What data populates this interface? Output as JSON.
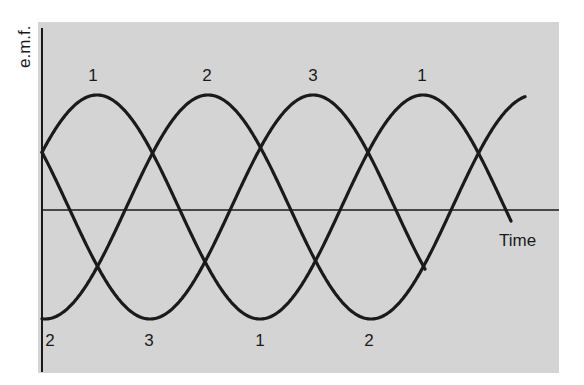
{
  "chart_data": {
    "type": "line",
    "title": "",
    "xlabel": "Time",
    "ylabel": "e.m.f.",
    "grid": false,
    "legend": "none (phases labeled directly at peaks and troughs)",
    "x": [
      0,
      30,
      60,
      90,
      120,
      150,
      180,
      210,
      240,
      270,
      300,
      330,
      360,
      390,
      420,
      450,
      480,
      510,
      540,
      570
    ],
    "x_unit": "phase angle (degrees), arbitrary; axis has no tick marks",
    "series": [
      {
        "name": "1",
        "phase_deg": 0,
        "values": [
          0.5,
          0.87,
          1.0,
          0.87,
          0.5,
          0.0,
          -0.5,
          -0.87,
          -1.0,
          -0.87,
          -0.5,
          0.0,
          0.5,
          0.87,
          1.0,
          0.87,
          0.5,
          0.0,
          -0.1,
          null
        ]
      },
      {
        "name": "2",
        "phase_deg": -120,
        "values": [
          -1.0,
          -0.87,
          -0.5,
          0.0,
          0.5,
          0.87,
          1.0,
          0.87,
          0.5,
          0.0,
          -0.5,
          -0.87,
          -1.0,
          -0.87,
          -0.5,
          0.0,
          0.5,
          0.87,
          1.0,
          null
        ]
      },
      {
        "name": "3",
        "phase_deg": 120,
        "values": [
          0.5,
          0.0,
          -0.5,
          -0.87,
          -1.0,
          -0.87,
          -0.5,
          0.0,
          0.5,
          0.87,
          1.0,
          0.87,
          0.5,
          0.0,
          -0.5,
          -0.6,
          null,
          null,
          null,
          null
        ]
      }
    ],
    "ylim": [
      -1.1,
      1.1
    ],
    "annotations": {
      "peaks": [
        "1",
        "2",
        "3",
        "1"
      ],
      "troughs": [
        "2",
        "3",
        "1",
        "2"
      ]
    }
  },
  "labels": {
    "y_axis": "e.m.f.",
    "x_axis": "Time",
    "peaks": [
      "1",
      "2",
      "3",
      "1"
    ],
    "troughs": [
      "2",
      "3",
      "1",
      "2"
    ]
  },
  "colors": {
    "background": "#ffffff",
    "panel": "#d4d4d4",
    "curve": "#1a1a1a",
    "axis": "#1a1a1a"
  },
  "geometry": {
    "x_origin": 42,
    "center_y": 207,
    "amplitude": 112,
    "period_px": 326,
    "curves": [
      {
        "name": "1",
        "peak_x": 97,
        "x_start": 42,
        "x_end": 511
      },
      {
        "name": "2",
        "peak_x": 208,
        "x_start": 42,
        "x_end": 525
      },
      {
        "name": "3",
        "peak_x": 313,
        "x_start": 42,
        "x_end": 425
      }
    ]
  }
}
